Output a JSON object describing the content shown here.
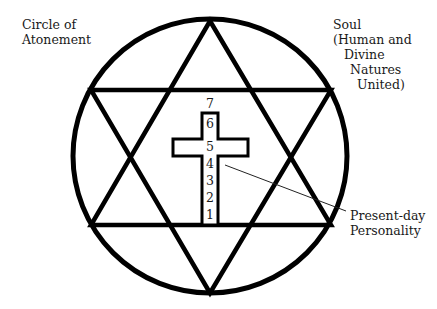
{
  "diagram": {
    "labels": {
      "circle_of_atonement": [
        "Circle of",
        "Atonement"
      ],
      "soul": [
        "Soul",
        "(Human and",
        "Divine",
        "Natures",
        "United)"
      ],
      "present_day_personality": [
        "Present-day",
        "Personality"
      ]
    },
    "cross_levels": [
      "1",
      "2",
      "3",
      "4",
      "5",
      "6",
      "7"
    ],
    "colors": {
      "stroke": "#000000",
      "background": "#ffffff",
      "text": "#1a1a1a"
    },
    "shapes": {
      "circle": {
        "cx": 210,
        "cy": 156,
        "r": 137
      },
      "star_of_david": "two overlapping equilateral triangles inscribed in circle",
      "cross": "Latin cross with levels 1-7 numbered bottom to top"
    }
  }
}
